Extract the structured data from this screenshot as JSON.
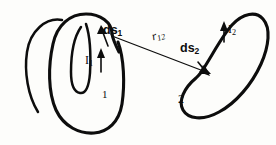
{
  "figure": {
    "kind": "physics-diagram",
    "background_color": "#fdfdfb",
    "ink_color": "#0d0d0d"
  },
  "labels": {
    "ds1": {
      "base": "ds",
      "sub": "1"
    },
    "current1": {
      "base": "I",
      "sub": "1"
    },
    "loop1": "1",
    "r12": {
      "base": "r",
      "sub": "12"
    },
    "ds2": {
      "base": "ds",
      "sub": "2"
    },
    "current2": {
      "base": "I",
      "sub": "2"
    },
    "loop2": "2"
  },
  "elements": {
    "loop1_name": "coil-loop-1",
    "loop2_name": "bean-loop-2",
    "vector_name": "separation-vector-r12",
    "current1_arrow": "current-direction-arrow-1",
    "current2_arrow": "current-direction-arrow-2",
    "ds1_arrow": "line-element-arrow-ds1",
    "ds2_arrow": "line-element-arrow-ds2"
  }
}
